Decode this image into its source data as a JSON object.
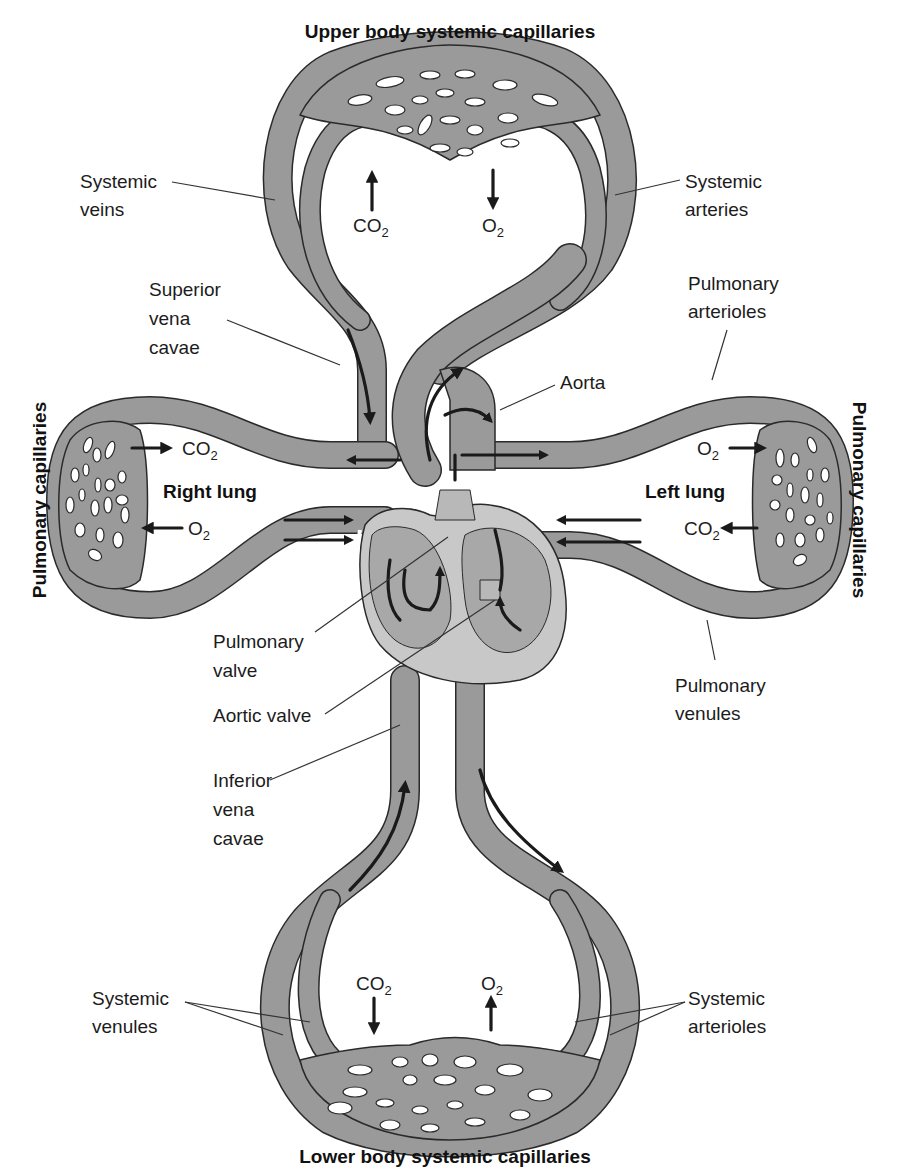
{
  "title_top": "Upper body systemic capillaries",
  "title_bottom": "Lower body systemic capillaries",
  "side_left": "Pulmonary capillaries",
  "side_right": "Pulmonary capillaries",
  "lungs": {
    "right": "Right lung",
    "left": "Left lung"
  },
  "labels": {
    "systemic_veins": [
      "Systemic",
      "veins"
    ],
    "systemic_arteries": [
      "Systemic",
      "arteries"
    ],
    "superior_vena_cavae": [
      "Superior",
      "vena",
      "cavae"
    ],
    "pulmonary_arterioles": [
      "Pulmonary",
      "arterioles"
    ],
    "aorta": "Aorta",
    "pulmonary_valve": [
      "Pulmonary",
      "valve"
    ],
    "aortic_valve": "Aortic valve",
    "pulmonary_venules": [
      "Pulmonary",
      "venules"
    ],
    "inferior_vena_cavae": [
      "Inferior",
      "vena",
      "cavae"
    ],
    "systemic_venules": [
      "Systemic",
      "venules"
    ],
    "systemic_arterioles": [
      "Systemic",
      "arterioles"
    ]
  },
  "gas_exchange": {
    "upper_co2": {
      "base": "CO",
      "sub": "2",
      "direction": "up"
    },
    "upper_o2": {
      "base": "O",
      "sub": "2",
      "direction": "down"
    },
    "right_lung_co2": {
      "base": "CO",
      "sub": "2",
      "direction": "right"
    },
    "right_lung_o2": {
      "base": "O",
      "sub": "2",
      "direction": "left"
    },
    "left_lung_o2": {
      "base": "O",
      "sub": "2",
      "direction": "right"
    },
    "left_lung_co2": {
      "base": "CO",
      "sub": "2",
      "direction": "left"
    },
    "lower_co2": {
      "base": "CO",
      "sub": "2",
      "direction": "down"
    },
    "lower_o2": {
      "base": "O",
      "sub": "2",
      "direction": "up"
    }
  },
  "colors": {
    "vessel": "#9a9a9a",
    "vessel_outline": "#2a2a2a",
    "heart_light": "#c8c8c8",
    "heart_mid": "#a8a8a8",
    "heart_dark": "#8c8c8c",
    "flow_arrow": "#1a1a1a",
    "background": "#ffffff"
  }
}
